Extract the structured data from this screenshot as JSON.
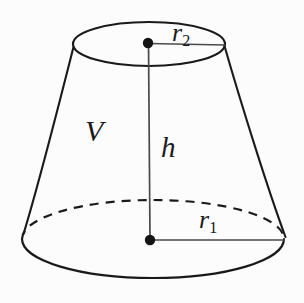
{
  "figure": {
    "kind": "geometry-diagram",
    "background_color": "#fcfcfc",
    "stroke_color": "#1a1a1a",
    "labels": {
      "volume": "V",
      "height": "h",
      "bottom_radius_symbol": "r",
      "bottom_radius_subscript": "1",
      "top_radius_symbol": "r",
      "top_radius_subscript": "2"
    },
    "geometry": {
      "top_ellipse": {
        "cx": 149,
        "cy": 44,
        "rx": 76,
        "ry": 22
      },
      "bottom_ellipse": {
        "cx": 153,
        "cy": 239,
        "rx": 131,
        "ry": 39
      },
      "axis": {
        "x1": 148,
        "y1": 43,
        "x2": 150,
        "y2": 240
      },
      "top_radius_line": {
        "x1": 148,
        "y1": 43,
        "x2": 225,
        "y2": 45
      },
      "bottom_radius_line": {
        "x1": 150,
        "y1": 240,
        "x2": 285,
        "y2": 240
      },
      "top_center_dot": {
        "cx": 148,
        "cy": 43,
        "r": 5
      },
      "bottom_center_dot": {
        "cx": 150,
        "cy": 240,
        "r": 5
      }
    }
  }
}
